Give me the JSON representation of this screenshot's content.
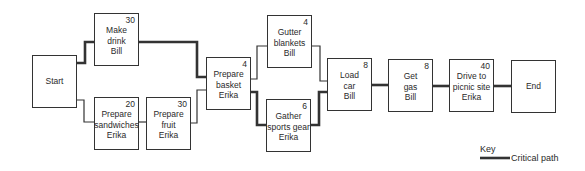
{
  "diagram": {
    "type": "activity network / critical path diagram",
    "nodes": [
      {
        "id": "start",
        "lines": [
          "Start"
        ],
        "duration": "",
        "x": 32,
        "y": 55,
        "terminal": true
      },
      {
        "id": "make-drink",
        "lines": [
          "Make",
          "drink",
          "Bill"
        ],
        "duration": "30",
        "x": 94,
        "y": 13
      },
      {
        "id": "prepare-sandwiches",
        "lines": [
          "Prepare",
          "sandwiches",
          "Erika"
        ],
        "duration": "20",
        "x": 94,
        "y": 97
      },
      {
        "id": "prepare-fruit",
        "lines": [
          "Prepare",
          "fruit",
          "Erika"
        ],
        "duration": "30",
        "x": 146,
        "y": 97
      },
      {
        "id": "prepare-basket",
        "lines": [
          "Prepare",
          "basket",
          "Erika"
        ],
        "duration": "4",
        "x": 206,
        "y": 57
      },
      {
        "id": "gutter-blankets",
        "lines": [
          "Gutter",
          "blankets",
          "Bill"
        ],
        "duration": "4",
        "x": 267,
        "y": 15
      },
      {
        "id": "gather-sports-gear",
        "lines": [
          "Gather",
          "sports gear",
          "Erika"
        ],
        "duration": "6",
        "x": 266,
        "y": 99
      },
      {
        "id": "load-car",
        "lines": [
          "Load",
          "car",
          "Bill"
        ],
        "duration": "8",
        "x": 327,
        "y": 58
      },
      {
        "id": "get-gas",
        "lines": [
          "Get",
          "gas",
          "Bill"
        ],
        "duration": "8",
        "x": 388,
        "y": 59
      },
      {
        "id": "drive-to-picnic-site",
        "lines": [
          "Drive to",
          "picnic site",
          "Erika"
        ],
        "duration": "40",
        "x": 449,
        "y": 59
      },
      {
        "id": "end",
        "lines": [
          "End"
        ],
        "duration": "",
        "x": 511,
        "y": 60,
        "terminal": true
      }
    ],
    "edges": [
      {
        "from": "start",
        "to": "make-drink",
        "critical": true
      },
      {
        "from": "start",
        "to": "prepare-sandwiches",
        "critical": false
      },
      {
        "from": "prepare-sandwiches",
        "to": "prepare-fruit",
        "critical": false
      },
      {
        "from": "make-drink",
        "to": "prepare-basket",
        "critical": true
      },
      {
        "from": "prepare-fruit",
        "to": "prepare-basket",
        "critical": false
      },
      {
        "from": "prepare-basket",
        "to": "gutter-blankets",
        "critical": false
      },
      {
        "from": "prepare-basket",
        "to": "gather-sports-gear",
        "critical": true
      },
      {
        "from": "gutter-blankets",
        "to": "load-car",
        "critical": false
      },
      {
        "from": "gather-sports-gear",
        "to": "load-car",
        "critical": true
      },
      {
        "from": "load-car",
        "to": "get-gas",
        "critical": true
      },
      {
        "from": "get-gas",
        "to": "drive-to-picnic-site",
        "critical": true
      },
      {
        "from": "drive-to-picnic-site",
        "to": "end",
        "critical": true
      }
    ]
  },
  "key": {
    "title": "Key",
    "critical_path_label": "Critical path"
  },
  "colors": {
    "line": "#333333",
    "critical": "#222222",
    "text": "#2a2a2a"
  }
}
